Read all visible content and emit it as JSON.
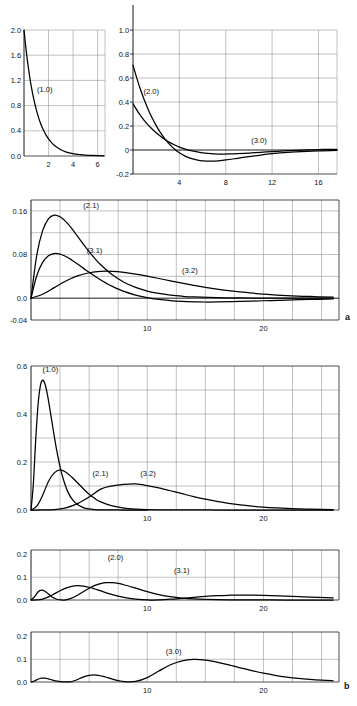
{
  "figure": {
    "part_a_label": "a",
    "part_b_label": "b"
  },
  "chart_data": [
    {
      "id": "panel1",
      "type": "line",
      "title": "",
      "xlabel": "",
      "ylabel": "",
      "xlim": [
        0,
        6.6
      ],
      "ylim": [
        0.0,
        2.0
      ],
      "xticks": [
        2,
        4,
        6
      ],
      "xticklabels": [
        "2",
        "4",
        "6"
      ],
      "yticks": [
        0.0,
        0.4,
        0.8,
        1.2,
        1.6,
        2.0
      ],
      "yticklabels": [
        "0.0",
        "0.4",
        "0.8",
        "1.2",
        "1.6",
        "2.0"
      ],
      "grid": true,
      "series": [
        {
          "name": "(1.0)",
          "label": "(1.0)",
          "label_x": 1.05,
          "label_y": 1.02,
          "x": [
            0.0,
            0.1,
            0.2,
            0.3,
            0.4,
            0.5,
            0.6,
            0.8,
            1.0,
            1.2,
            1.4,
            1.6,
            1.8,
            2.0,
            2.3,
            2.6,
            3.0,
            3.4,
            3.8,
            4.2,
            4.6,
            5.0,
            5.5,
            6.0,
            6.5
          ],
          "values": [
            2.0,
            1.81,
            1.637,
            1.482,
            1.341,
            1.213,
            1.098,
            0.898,
            0.736,
            0.602,
            0.493,
            0.404,
            0.331,
            0.271,
            0.2,
            0.149,
            0.0996,
            0.0667,
            0.0447,
            0.03,
            0.0201,
            0.0135,
            0.0082,
            0.005,
            0.003
          ]
        }
      ]
    },
    {
      "id": "panel2",
      "type": "line",
      "title": "",
      "xlabel": "",
      "ylabel": "",
      "xlim": [
        0,
        17.6
      ],
      "ylim": [
        -0.2,
        1.0
      ],
      "xticks": [
        4,
        8,
        12,
        16
      ],
      "xticklabels": [
        "4",
        "8",
        "12",
        "16"
      ],
      "yticks": [
        -0.2,
        0.0,
        0.2,
        0.4,
        0.6,
        0.8,
        1.0
      ],
      "yticklabels": [
        "-0.2",
        "0",
        "0.2",
        "0.4",
        "0.6",
        "0.8",
        "1.0"
      ],
      "grid": true,
      "series": [
        {
          "name": "(2.0)",
          "label": "(2.0)",
          "label_x": 0.9,
          "label_y": 0.47,
          "x": [
            0.0,
            0.2,
            0.4,
            0.6,
            0.8,
            1.0,
            1.3,
            1.6,
            2.0,
            2.4,
            2.8,
            3.2,
            3.6,
            4.0,
            4.5,
            5.0,
            5.5,
            6.0,
            7.0,
            8.0,
            9.0,
            10.0,
            11.0,
            12.0,
            13.0,
            14.0,
            15.0,
            16.0,
            17.0,
            17.6
          ],
          "values": [
            0.707,
            0.64,
            0.576,
            0.517,
            0.462,
            0.411,
            0.34,
            0.277,
            0.203,
            0.14,
            0.0865,
            0.0423,
            0.0063,
            -0.0229,
            -0.0506,
            -0.0699,
            -0.0825,
            -0.0898,
            -0.0918,
            -0.0827,
            -0.0693,
            -0.055,
            -0.0419,
            -0.0309,
            -0.0222,
            -0.0156,
            -0.0107,
            -0.0073,
            -0.0049,
            -0.0038
          ]
        },
        {
          "name": "(3.0)",
          "label": "(3.0)",
          "label_x": 10.2,
          "label_y": 0.062,
          "x": [
            0.0,
            0.2,
            0.4,
            0.6,
            0.8,
            1.0,
            1.3,
            1.6,
            2.0,
            2.4,
            2.8,
            3.2,
            3.6,
            4.0,
            4.5,
            5.0,
            6.0,
            7.0,
            7.8,
            8.5,
            9.0,
            10.0,
            11.0,
            12.0,
            13.0,
            14.0,
            15.0,
            16.0,
            17.0,
            17.6
          ],
          "values": [
            0.385,
            0.353,
            0.322,
            0.294,
            0.267,
            0.242,
            0.209,
            0.179,
            0.143,
            0.112,
            0.0846,
            0.0613,
            0.0414,
            0.0246,
            0.0074,
            -0.0059,
            -0.0233,
            -0.0321,
            -0.034,
            -0.0327,
            -0.0311,
            -0.0258,
            -0.0196,
            -0.0133,
            -0.0076,
            -0.0027,
            0.001,
            0.0036,
            0.0051,
            0.0055
          ]
        }
      ]
    },
    {
      "id": "panel3",
      "type": "line",
      "title": "",
      "xlabel": "",
      "ylabel": "",
      "xlim": [
        0,
        26.5
      ],
      "ylim": [
        -0.04,
        0.18
      ],
      "xticks": [
        10,
        20
      ],
      "xticklabels": [
        "10",
        "20"
      ],
      "yticks": [
        -0.04,
        0.0,
        0.08,
        0.16
      ],
      "yticklabels": [
        "-0.04",
        "0.0",
        "0.08",
        "0.16"
      ],
      "grid": true,
      "series": [
        {
          "name": "(2.1)",
          "label": "(2.1)",
          "label_x": 4.5,
          "label_y": 0.166,
          "x": [
            0.0,
            0.5,
            1.0,
            1.5,
            2.0,
            2.5,
            3.0,
            3.5,
            4.0,
            4.5,
            5.0,
            5.5,
            6.0,
            7.0,
            8.0,
            9.0,
            10.0,
            11.0,
            12.0,
            13.0,
            14.0,
            16.0,
            18.0,
            20.0,
            22.0,
            24.0,
            26.0
          ],
          "values": [
            0.0,
            0.0795,
            0.1238,
            0.1455,
            0.1522,
            0.1493,
            0.1403,
            0.1279,
            0.1136,
            0.0993,
            0.0854,
            0.0726,
            0.0613,
            0.0428,
            0.0293,
            0.0197,
            0.0131,
            0.0086,
            0.0056,
            0.0036,
            0.0023,
            0.0009,
            0.00035,
            0.00013,
            5e-05,
            2e-05,
            0.0
          ]
        },
        {
          "name": "(3.1)",
          "label": "(3.1)",
          "label_x": 4.8,
          "label_y": 0.083,
          "x": [
            0.0,
            0.5,
            1.0,
            1.5,
            2.0,
            2.5,
            3.0,
            3.5,
            4.0,
            4.5,
            5.0,
            5.5,
            6.0,
            6.5,
            7.0,
            8.0,
            9.0,
            10.0,
            11.0,
            12.0,
            13.0,
            14.0,
            15.0,
            16.0,
            18.0,
            20.0,
            22.0,
            24.0,
            26.0
          ],
          "values": [
            0.0,
            0.0415,
            0.0656,
            0.0777,
            0.0818,
            0.0807,
            0.0764,
            0.0701,
            0.0628,
            0.0551,
            0.0474,
            0.0401,
            0.0333,
            0.0271,
            0.0216,
            0.0124,
            0.0057,
            0.0009,
            -0.0024,
            -0.0046,
            -0.006,
            -0.0067,
            -0.007,
            -0.0069,
            -0.006,
            -0.0047,
            -0.0034,
            -0.0023,
            -0.0015
          ]
        },
        {
          "name": "(3.2)",
          "label": "(3.2)",
          "label_x": 13.0,
          "label_y": 0.046,
          "x": [
            0.0,
            1.0,
            2.0,
            3.0,
            4.0,
            5.0,
            6.0,
            7.0,
            8.0,
            9.0,
            10.0,
            11.0,
            12.0,
            13.0,
            14.0,
            15.0,
            16.0,
            17.0,
            18.0,
            19.0,
            20.0,
            22.0,
            24.0,
            26.0
          ],
          "values": [
            0.0,
            0.0072,
            0.0194,
            0.0315,
            0.0408,
            0.0466,
            0.0492,
            0.0491,
            0.0472,
            0.0441,
            0.0403,
            0.0361,
            0.0318,
            0.0276,
            0.0236,
            0.02,
            0.0167,
            0.0139,
            0.0114,
            0.0093,
            0.0076,
            0.0049,
            0.0031,
            0.0019
          ]
        }
      ]
    },
    {
      "id": "panel4",
      "type": "line",
      "title": "",
      "xlabel": "",
      "ylabel": "",
      "xlim": [
        0,
        26.5
      ],
      "ylim": [
        0.0,
        0.6
      ],
      "xticks": [
        10,
        20
      ],
      "xticklabels": [
        "10",
        "20"
      ],
      "yticks": [
        0.0,
        0.2,
        0.4,
        0.6
      ],
      "yticklabels": [
        "0.0",
        "0.2",
        "0.4",
        "0.6"
      ],
      "grid": true,
      "series": [
        {
          "name": "(1.0)",
          "label": "(1.0)",
          "label_x": 1.0,
          "label_y": 0.575,
          "x": [
            0.0,
            0.2,
            0.4,
            0.6,
            0.8,
            1.0,
            1.2,
            1.4,
            1.6,
            1.8,
            2.0,
            2.2,
            2.5,
            2.8,
            3.2,
            3.6,
            4.0,
            4.5,
            5.0,
            5.5,
            6.0,
            7.0,
            8.0,
            9.0,
            10.0
          ],
          "values": [
            0.0,
            0.107,
            0.288,
            0.434,
            0.516,
            0.541,
            0.525,
            0.484,
            0.428,
            0.368,
            0.308,
            0.252,
            0.18,
            0.125,
            0.0724,
            0.0409,
            0.0227,
            0.0101,
            0.00437,
            0.00185,
            0.00077,
            0.000127,
            2e-05,
            0.0,
            0.0
          ]
        },
        {
          "name": "(2.1)",
          "label": "(2.1)",
          "label_x": 5.3,
          "label_y": 0.141,
          "x": [
            0.0,
            0.5,
            1.0,
            1.5,
            2.0,
            2.5,
            3.0,
            3.5,
            4.0,
            4.5,
            5.0,
            5.5,
            6.0,
            7.0,
            8.0,
            9.0,
            10.0,
            11.0,
            12.0,
            13.0,
            14.0,
            16.0,
            18.0,
            20.0,
            22.0,
            24.0,
            26.0
          ],
          "values": [
            0.0,
            0.0158,
            0.0613,
            0.1191,
            0.1545,
            0.1672,
            0.1574,
            0.1373,
            0.1136,
            0.0888,
            0.0657,
            0.0475,
            0.0338,
            0.0168,
            0.00802,
            0.00372,
            0.00169,
            0.00076,
            0.00034,
            0.00015,
            6e-05,
            1e-05,
            0.0,
            0.0,
            0.0,
            0.0,
            0.0
          ]
        },
        {
          "name": "(3.2)",
          "label": "(3.2)",
          "label_x": 9.4,
          "label_y": 0.141,
          "x": [
            0.0,
            1.0,
            2.0,
            3.0,
            4.0,
            5.0,
            6.0,
            7.0,
            8.0,
            9.0,
            10.0,
            11.0,
            12.0,
            13.0,
            14.0,
            15.0,
            16.0,
            17.0,
            18.0,
            19.0,
            20.0,
            21.0,
            22.0,
            23.0,
            24.0,
            26.0
          ],
          "values": [
            0.0,
            5e-05,
            0.0015,
            0.0089,
            0.0266,
            0.0543,
            0.0872,
            0.1006,
            0.1068,
            0.1085,
            0.1017,
            0.0918,
            0.0802,
            0.0678,
            0.0558,
            0.045,
            0.0358,
            0.0279,
            0.0214,
            0.0163,
            0.0122,
            0.0091,
            0.0067,
            0.0049,
            0.0035,
            0.0018
          ]
        }
      ]
    },
    {
      "id": "panel5",
      "type": "line",
      "title": "",
      "xlabel": "",
      "ylabel": "",
      "xlim": [
        0,
        26.5
      ],
      "ylim": [
        0.0,
        0.22
      ],
      "xticks": [
        10,
        20
      ],
      "xticklabels": [
        "10",
        "20"
      ],
      "yticks": [
        0.0,
        0.1,
        0.2
      ],
      "yticklabels": [
        "0.0",
        "0.1",
        "0.2"
      ],
      "grid": true,
      "series": [
        {
          "name": "(2.0)",
          "label": "(2.0)",
          "label_x": 6.6,
          "label_y": 0.176,
          "x": [
            0.0,
            0.3,
            0.6,
            0.9,
            1.2,
            1.5,
            1.8,
            2.0,
            2.3,
            2.6,
            3.0,
            3.5,
            4.0,
            4.5,
            5.0,
            5.5,
            6.0,
            6.5,
            7.0,
            7.5,
            8.0,
            9.0,
            10.0,
            11.0,
            12.0,
            13.0,
            14.0,
            16.0,
            18.0,
            20.0,
            22.0,
            26.0
          ],
          "values": [
            0.0,
            0.0138,
            0.0353,
            0.0436,
            0.0386,
            0.0265,
            0.0137,
            0.0082,
            0.00217,
            0.0001,
            0.00102,
            0.0083,
            0.0209,
            0.0364,
            0.0515,
            0.064,
            0.0722,
            0.0763,
            0.0762,
            0.0729,
            0.0671,
            0.0523,
            0.0368,
            0.0239,
            0.0145,
            0.0084,
            0.0046,
            0.00127,
            0.00032,
            8e-05,
            2e-05,
            0.0
          ]
        },
        {
          "name": "(3.1)",
          "label": "(3.1)",
          "label_x": 12.3,
          "label_y": 0.121,
          "x": [
            0.0,
            0.5,
            1.0,
            1.5,
            2.0,
            2.5,
            3.0,
            3.5,
            4.0,
            4.5,
            5.0,
            5.5,
            6.0,
            7.0,
            8.0,
            9.0,
            10.0,
            11.0,
            12.0,
            13.0,
            14.0,
            15.0,
            16.0,
            17.0,
            18.0,
            20.0,
            22.0,
            24.0,
            26.0
          ],
          "values": [
            0.0,
            0.0004,
            0.00431,
            0.0136,
            0.0268,
            0.0407,
            0.0525,
            0.0603,
            0.0631,
            0.0615,
            0.0561,
            0.0485,
            0.04,
            0.0236,
            0.0117,
            0.0041,
            0.0001,
            0.0007,
            0.00345,
            0.00756,
            0.0118,
            0.0157,
            0.0188,
            0.0207,
            0.0216,
            0.0203,
            0.0167,
            0.0128,
            0.0093
          ]
        }
      ]
    },
    {
      "id": "panel6",
      "type": "line",
      "title": "",
      "xlabel": "",
      "ylabel": "",
      "xlim": [
        0,
        26.5
      ],
      "ylim": [
        0.0,
        0.22
      ],
      "xticks": [
        10,
        20
      ],
      "xticklabels": [
        "10",
        "20"
      ],
      "yticks": [
        0.0,
        0.1,
        0.2
      ],
      "yticklabels": [
        "0.0",
        "0.1",
        "0.2"
      ],
      "grid": true,
      "series": [
        {
          "name": "(3.0)",
          "label": "(3.0)",
          "label_x": 11.6,
          "label_y": 0.124,
          "x": [
            0.0,
            0.3,
            0.6,
            0.9,
            1.2,
            1.5,
            1.8,
            2.1,
            2.4,
            2.7,
            3.0,
            3.4,
            3.8,
            4.2,
            4.6,
            5.0,
            5.4,
            5.8,
            6.2,
            6.6,
            7.0,
            7.4,
            7.8,
            8.2,
            9.0,
            10.0,
            11.0,
            12.0,
            13.0,
            14.0,
            15.0,
            16.0,
            17.0,
            18.0,
            19.0,
            20.0,
            21.0,
            22.0,
            23.0,
            24.0,
            25.0,
            26.0
          ],
          "values": [
            0.0,
            0.00448,
            0.0121,
            0.0167,
            0.0169,
            0.0136,
            0.00917,
            0.0052,
            0.0024,
            0.00083,
            0.00017,
            0.00086,
            0.00648,
            0.0153,
            0.0239,
            0.0295,
            0.0313,
            0.0295,
            0.025,
            0.0189,
            0.0127,
            0.00724,
            0.00328,
            0.00094,
            0.00245,
            0.0195,
            0.0481,
            0.0757,
            0.0934,
            0.0995,
            0.0963,
            0.0873,
            0.0753,
            0.0624,
            0.0499,
            0.0388,
            0.0294,
            0.0218,
            0.0158,
            0.0113,
            0.0079,
            0.0054
          ]
        }
      ]
    }
  ]
}
